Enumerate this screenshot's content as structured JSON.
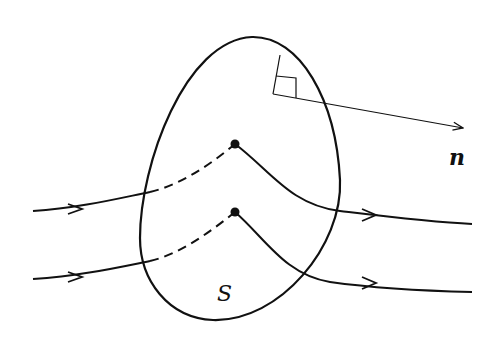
{
  "figure": {
    "surface_label": "S",
    "normal_label": "n",
    "colors": {
      "background": "#ffffff",
      "ink": "#111111"
    },
    "field_lines": [
      {
        "name": "upper-field-line",
        "pass_point": [
          235,
          144
        ]
      },
      {
        "name": "lower-field-line",
        "pass_point": [
          235,
          212
        ]
      }
    ]
  }
}
